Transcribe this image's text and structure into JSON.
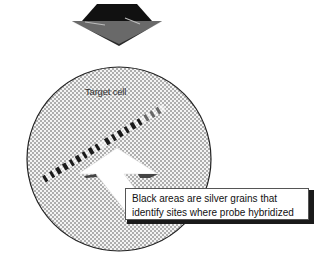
{
  "diagram": {
    "labels": {
      "target_cell": "Target cell",
      "caption_line1": "Black areas are silver grains that",
      "caption_line2": "identify sites where probe hybridized"
    },
    "elements": {
      "top_shape": "emulsion-covered slide (dark trapezoid/diamond)",
      "cell": "stippled circle",
      "chromosome": "banded chromosome with black silver-grain bands",
      "arrow": "white block arrow pointing up-left toward chromosome"
    },
    "colors": {
      "background": "#ffffff",
      "stipple": "#555555",
      "dark": "#1a1a1a",
      "text": "#111111"
    }
  }
}
